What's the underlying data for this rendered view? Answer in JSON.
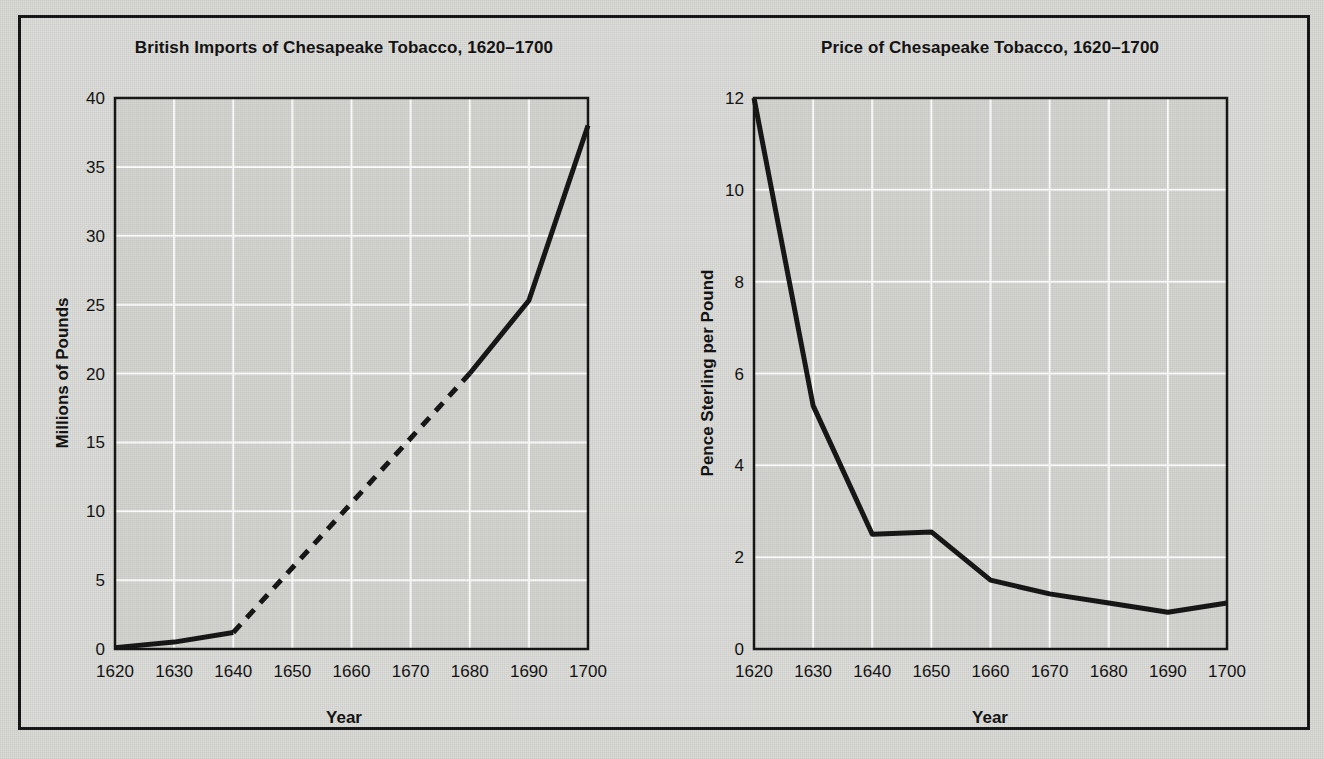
{
  "figure": {
    "background_color": "#d9d9d6",
    "frame_color": "#111111",
    "plot_background_color": "#d4d4d1",
    "gridline_color": "#ffffff",
    "line_color": "#111111"
  },
  "charts": [
    {
      "id": "british-imports",
      "title": "British Imports of Chesapeake Tobacco, 1620–1700",
      "xlabel": "Year",
      "ylabel": "Millions of Pounds",
      "xticks": [
        "1620",
        "1630",
        "1640",
        "1650",
        "1660",
        "1670",
        "1680",
        "1690",
        "1700"
      ],
      "yticks": [
        "0",
        "5",
        "10",
        "15",
        "20",
        "25",
        "30",
        "35",
        "40"
      ]
    },
    {
      "id": "tobacco-price",
      "title": "Price of Chesapeake Tobacco, 1620–1700",
      "xlabel": "Year",
      "ylabel": "Pence Sterling per Pound",
      "xticks": [
        "1620",
        "1630",
        "1640",
        "1650",
        "1660",
        "1670",
        "1680",
        "1690",
        "1700"
      ],
      "yticks": [
        "0",
        "2",
        "4",
        "6",
        "8",
        "10",
        "12"
      ]
    }
  ],
  "chart_data": [
    {
      "type": "line",
      "title": "British Imports of Chesapeake Tobacco, 1620–1700",
      "xlabel": "Year",
      "ylabel": "Millions of Pounds",
      "x": [
        1620,
        1630,
        1640,
        1650,
        1660,
        1670,
        1680,
        1690,
        1700
      ],
      "values": [
        0.1,
        0.5,
        1.2,
        5.9,
        10.6,
        15.3,
        20.0,
        25.3,
        38.0
      ],
      "xlim": [
        1620,
        1700
      ],
      "ylim": [
        0,
        40
      ],
      "xticks": [
        1620,
        1630,
        1640,
        1650,
        1660,
        1670,
        1680,
        1690,
        1700
      ],
      "yticks": [
        0,
        5,
        10,
        15,
        20,
        25,
        30,
        35,
        40
      ],
      "grid": true,
      "legend": "none",
      "segments": [
        {
          "style": "solid",
          "from_x": 1620,
          "to_x": 1640,
          "note": "observed data"
        },
        {
          "style": "dashed",
          "from_x": 1640,
          "to_x": 1680,
          "note": "interpolated / estimated"
        },
        {
          "style": "solid",
          "from_x": 1680,
          "to_x": 1700,
          "note": "observed data"
        }
      ]
    },
    {
      "type": "line",
      "title": "Price of Chesapeake Tobacco, 1620–1700",
      "xlabel": "Year",
      "ylabel": "Pence Sterling per Pound",
      "x": [
        1620,
        1630,
        1640,
        1650,
        1660,
        1670,
        1680,
        1690,
        1700
      ],
      "values": [
        12.0,
        5.3,
        2.5,
        2.55,
        1.5,
        1.2,
        1.0,
        0.8,
        1.0
      ],
      "xlim": [
        1620,
        1700
      ],
      "ylim": [
        0,
        12
      ],
      "xticks": [
        1620,
        1630,
        1640,
        1650,
        1660,
        1670,
        1680,
        1690,
        1700
      ],
      "yticks": [
        0,
        2,
        4,
        6,
        8,
        10,
        12
      ],
      "grid": true,
      "legend": "none",
      "segments": [
        {
          "style": "solid",
          "from_x": 1620,
          "to_x": 1700,
          "note": "observed data"
        }
      ]
    }
  ]
}
